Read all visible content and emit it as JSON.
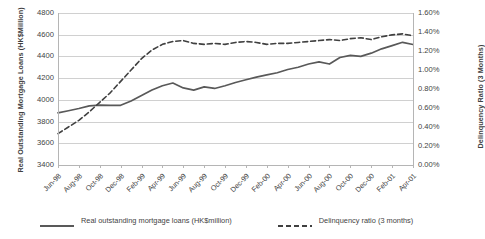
{
  "chart_data": {
    "type": "line",
    "title": "",
    "xlabel": "",
    "grid": "horizontal",
    "legend_position": "bottom",
    "x": [
      "Jun-98",
      "Jul-98",
      "Aug-98",
      "Sep-98",
      "Oct-98",
      "Nov-98",
      "Dec-98",
      "Jan-99",
      "Feb-99",
      "Mar-99",
      "Apr-99",
      "May-99",
      "Jun-99",
      "Jul-99",
      "Aug-99",
      "Sep-99",
      "Oct-99",
      "Nov-99",
      "Dec-99",
      "Jan-00",
      "Feb-00",
      "Mar-00",
      "Apr-00",
      "May-00",
      "Jun-00",
      "Jul-00",
      "Aug-00",
      "Sep-00",
      "Oct-00",
      "Nov-00",
      "Dec-00",
      "Jan-01",
      "Feb-01",
      "Mar-01",
      "Apr-01"
    ],
    "xtick_labels": [
      "Jun-98",
      "Aug-98",
      "Oct-98",
      "Dec-98",
      "Feb-99",
      "Apr-99",
      "Jun-99",
      "Aug-99",
      "Oct-99",
      "Dec-99",
      "Feb-00",
      "Apr-00",
      "Jun-00",
      "Aug-00",
      "Oct-00",
      "Dec-00",
      "Feb-01",
      "Apr-01"
    ],
    "axes": {
      "left": {
        "label": "Real Outstanding Mortgage Loans (HK$Million)",
        "ylim": [
          3400,
          4800
        ],
        "tick_step": 200,
        "ticks": [
          "3400",
          "3600",
          "3800",
          "4000",
          "4200",
          "4400",
          "4600",
          "4800"
        ]
      },
      "right": {
        "label": "Delinquency Ratio (3 Months)",
        "ylim": [
          0.0,
          1.6
        ],
        "tick_step": 0.2,
        "ticks": [
          "0.00%",
          "0.20%",
          "0.40%",
          "0.60%",
          "0.80%",
          "1.00%",
          "1.20%",
          "1.40%",
          "1.60%"
        ]
      }
    },
    "series": [
      {
        "name": "Real outstanding mortgage loans (HK$million)",
        "axis": "left",
        "style": "solid",
        "color": "#595959",
        "values": [
          3880,
          3900,
          3920,
          3945,
          3952,
          3950,
          3950,
          3990,
          4040,
          4090,
          4130,
          4155,
          4110,
          4090,
          4120,
          4105,
          4130,
          4160,
          4185,
          4210,
          4230,
          4250,
          4280,
          4300,
          4330,
          4350,
          4330,
          4390,
          4410,
          4400,
          4430,
          4470,
          4500,
          4530,
          4510
        ]
      },
      {
        "name": "Delinquency ratio (3 months)",
        "axis": "right",
        "style": "dashed",
        "color": "#404040",
        "values": [
          0.33,
          0.4,
          0.47,
          0.56,
          0.66,
          0.76,
          0.88,
          1.0,
          1.12,
          1.21,
          1.27,
          1.3,
          1.31,
          1.28,
          1.27,
          1.28,
          1.27,
          1.29,
          1.3,
          1.29,
          1.27,
          1.28,
          1.28,
          1.29,
          1.3,
          1.31,
          1.32,
          1.31,
          1.33,
          1.34,
          1.32,
          1.35,
          1.37,
          1.38,
          1.36
        ]
      }
    ]
  },
  "legend": {
    "items": [
      {
        "label": "Real outstanding mortgage loans (HK$million)",
        "style": "solid",
        "color": "#595959"
      },
      {
        "label": "Delinquency ratio (3 months)",
        "style": "dashed",
        "color": "#404040"
      }
    ]
  }
}
